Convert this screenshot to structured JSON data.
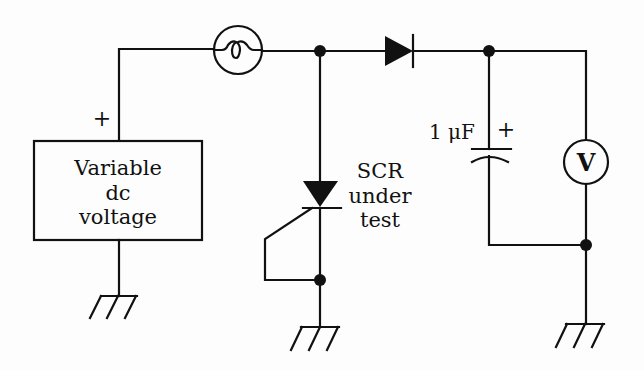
{
  "diagram": {
    "type": "circuit-schematic",
    "title": "",
    "colors": {
      "ink": "#111111",
      "background": "#fdfdfd"
    },
    "source": {
      "label_lines": [
        "Variable",
        "dc",
        "voltage"
      ],
      "polarity": "+"
    },
    "lamp": {
      "symbol": "lamp-filament"
    },
    "diode": {
      "symbol": "diode"
    },
    "scr": {
      "label_lines": [
        "SCR",
        "under",
        "test"
      ]
    },
    "capacitor": {
      "value": "1 μF",
      "polarity": "+"
    },
    "voltmeter": {
      "symbol_text": "V"
    },
    "grounds": 3
  }
}
